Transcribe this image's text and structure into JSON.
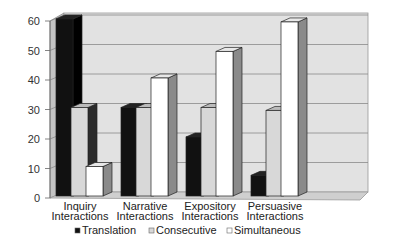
{
  "chart_data": {
    "type": "bar",
    "style": "3d-clustered-column",
    "title": "",
    "xlabel": "",
    "ylabel": "",
    "categories": [
      [
        "Inquiry",
        "Interactions"
      ],
      [
        "Narrative",
        "Interactions"
      ],
      [
        "Expository",
        "Interactions"
      ],
      [
        "Persuasive",
        "Interactions"
      ]
    ],
    "category_labels": [
      "Inquiry Interactions",
      "Narrative Interactions",
      "Expository Interactions",
      "Persuasive Interactions"
    ],
    "series": [
      {
        "name": "Translation",
        "values": [
          60,
          30,
          20,
          7
        ],
        "color": "#111111",
        "side": "#000000",
        "top": "#222222"
      },
      {
        "name": "Consecutive",
        "values": [
          30,
          30,
          30,
          29
        ],
        "color": "#d8d8d8",
        "side": "#2b2b2b",
        "top": "#bbbbbb"
      },
      {
        "name": "Simultaneous",
        "values": [
          10,
          40,
          49,
          59
        ],
        "color": "#ffffff",
        "side": "#8a8a8a",
        "top": "#e8e8e8"
      }
    ],
    "yticks": [
      0,
      10,
      20,
      30,
      40,
      50,
      60
    ],
    "ylim": [
      0,
      60
    ],
    "grid": true,
    "legend": {
      "position": "bottom",
      "entries": [
        "Translation",
        "Consecutive",
        "Simultaneous"
      ]
    }
  }
}
